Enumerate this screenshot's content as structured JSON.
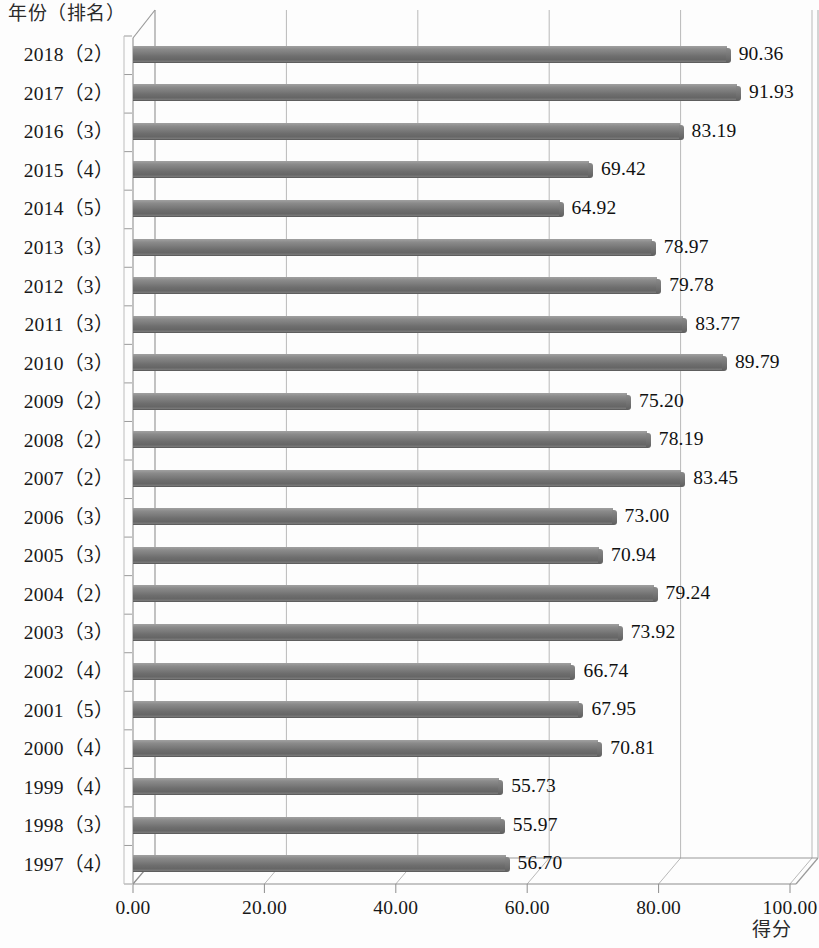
{
  "chart_data": {
    "type": "bar",
    "orientation": "horizontal",
    "title": "",
    "ylabel": "年份（排名）",
    "xlabel": "得分",
    "xlim": [
      0,
      100
    ],
    "xticks": [
      "0.00",
      "20.00",
      "40.00",
      "60.00",
      "80.00",
      "100.00"
    ],
    "xtick_values": [
      0,
      20,
      40,
      60,
      80,
      100
    ],
    "grid": "vertical",
    "legend": "none",
    "value_label_format": "0.00",
    "bar_color": "#777777",
    "categories": [
      "2018（2）",
      "2017（2）",
      "2016（3）",
      "2015（4）",
      "2014（5）",
      "2013（3）",
      "2012（3）",
      "2011（3）",
      "2010（3）",
      "2009（2）",
      "2008（2）",
      "2007（2）",
      "2006（3）",
      "2005（3）",
      "2004（2）",
      "2003（3）",
      "2002（4）",
      "2001（5）",
      "2000（4）",
      "1999（4）",
      "1998（3）",
      "1997（4）"
    ],
    "values": [
      90.36,
      91.93,
      83.19,
      69.42,
      64.92,
      78.97,
      79.78,
      83.77,
      89.79,
      75.2,
      78.19,
      83.45,
      73.0,
      70.94,
      79.24,
      73.92,
      66.74,
      67.95,
      70.81,
      55.73,
      55.97,
      56.7
    ],
    "value_labels": [
      "90.36",
      "91.93",
      "83.19",
      "69.42",
      "64.92",
      "78.97",
      "79.78",
      "83.77",
      "89.79",
      "75.20",
      "78.19",
      "83.45",
      "73.00",
      "70.94",
      "79.24",
      "73.92",
      "66.74",
      "67.95",
      "70.81",
      "55.73",
      "55.97",
      "56.70"
    ],
    "years": [
      "2018",
      "2017",
      "2016",
      "2015",
      "2014",
      "2013",
      "2012",
      "2011",
      "2010",
      "2009",
      "2008",
      "2007",
      "2006",
      "2005",
      "2004",
      "2003",
      "2002",
      "2001",
      "2000",
      "1999",
      "1998",
      "1997"
    ],
    "ranks": [
      2,
      2,
      3,
      4,
      5,
      3,
      3,
      3,
      3,
      2,
      2,
      2,
      3,
      3,
      2,
      3,
      4,
      5,
      4,
      4,
      3,
      4
    ]
  }
}
